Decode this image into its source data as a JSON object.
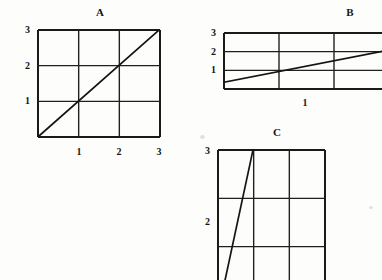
{
  "figure": {
    "background_color": "#fdfdfb",
    "ink_color": "#1a1a1a",
    "width": 382,
    "height": 280
  },
  "panels": [
    {
      "id": "A",
      "title": "A",
      "title_x": 100,
      "title_y": 7,
      "plot": {
        "x": 38,
        "y": 30,
        "width": 122,
        "height": 107,
        "cols": 3,
        "rows": 3
      },
      "y_ticks": [
        {
          "label": "3",
          "value": 3,
          "y": 30
        },
        {
          "label": "2",
          "value": 2,
          "y": 66
        },
        {
          "label": "1",
          "value": 1,
          "y": 101
        }
      ],
      "x_ticks": [
        {
          "label": "1",
          "value": 1,
          "x": 79
        },
        {
          "label": "2",
          "value": 2,
          "x": 119
        },
        {
          "label": "3",
          "value": 3,
          "x": 159
        }
      ],
      "line": {
        "name": "diagonal-line-a",
        "slope_description": "rises from bottom-left corner to top-right corner, slope 1",
        "x1": 39,
        "y1": 136,
        "x2": 158,
        "y2": 31
      }
    },
    {
      "id": "B",
      "title": "B",
      "title_x": 350,
      "title_y": 7,
      "plot": {
        "x": 224,
        "y": 33,
        "width": 165,
        "height": 56,
        "cols": 3,
        "rows": 3,
        "clipped_right": true
      },
      "y_ticks": [
        {
          "label": "3",
          "value": 3,
          "y": 33
        },
        {
          "label": "2",
          "value": 2,
          "y": 52
        },
        {
          "label": "1",
          "value": 1,
          "y": 70
        }
      ],
      "x_ticks": [
        {
          "label": "1",
          "value": 1,
          "x": 305
        }
      ],
      "line": {
        "name": "diagonal-line-b",
        "slope_description": "shallow rise from lower-left to right edge, slope less than 1",
        "x1": 225,
        "y1": 82,
        "x2": 389,
        "y2": 50
      }
    },
    {
      "id": "C",
      "title": "C",
      "title_x": 277,
      "title_y": 127,
      "plot": {
        "x": 218,
        "y": 150,
        "width": 107,
        "height": 145,
        "cols": 3,
        "rows": 3,
        "clipped_bottom": true
      },
      "y_ticks": [
        {
          "label": "3",
          "value": 3,
          "y": 150
        },
        {
          "label": "2",
          "value": 2,
          "y": 222
        }
      ],
      "x_ticks": [],
      "line": {
        "name": "steep-line-c",
        "slope_description": "very steep rise from bottom-left toward top, slope much greater than 1",
        "x1": 224,
        "y1": 285,
        "x2": 253,
        "y2": 150
      }
    }
  ],
  "chart_data": {
    "type": "line",
    "title": "",
    "subtitle": "",
    "xlabel": "",
    "ylabel": "",
    "grid": true,
    "legend_position": "none",
    "panels": [
      {
        "name": "A",
        "type": "line",
        "xlim": [
          0,
          3
        ],
        "ylim": [
          0,
          3
        ],
        "xticks": [
          1,
          2,
          3
        ],
        "yticks": [
          1,
          2,
          3
        ],
        "xticklabels": [
          "1",
          "2",
          "3"
        ],
        "yticklabels": [
          "1",
          "2",
          "3"
        ],
        "series": [
          {
            "name": "line-a",
            "x": [
              0,
              3
            ],
            "y": [
              0,
              3
            ],
            "slope": 1,
            "intercept": 0
          }
        ]
      },
      {
        "name": "B",
        "type": "line",
        "xlim": [
          0,
          4
        ],
        "ylim": [
          0,
          3
        ],
        "xticks": [
          1
        ],
        "yticks": [
          1,
          2,
          3
        ],
        "xticklabels": [
          "1"
        ],
        "yticklabels": [
          "1",
          "2",
          "3"
        ],
        "series": [
          {
            "name": "line-b",
            "x": [
              0,
              4
            ],
            "y": [
              0.35,
              2.1
            ],
            "slope": 0.44,
            "intercept": 0.35
          }
        ]
      },
      {
        "name": "C",
        "type": "line",
        "xlim": [
          0,
          3
        ],
        "ylim": [
          0,
          3
        ],
        "xticks": [],
        "yticks": [
          2,
          3
        ],
        "xticklabels": [],
        "yticklabels": [
          "2",
          "3"
        ],
        "series": [
          {
            "name": "line-c",
            "x": [
              0.17,
              0.98
            ],
            "y": [
              0,
              3
            ],
            "slope": 3.7,
            "intercept": -0.63
          }
        ]
      }
    ]
  }
}
